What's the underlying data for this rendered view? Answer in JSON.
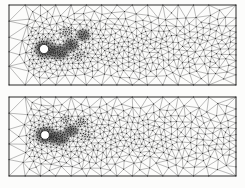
{
  "figure": {
    "background": "#fcfcfb",
    "width": 245,
    "height": 188
  },
  "mesh_style": {
    "line_color": "#3b3b3b",
    "line_width": 0.35,
    "node_color": "#161616",
    "node_size": 1.0,
    "border_color": "#2a2a2a",
    "border_width": 0.8,
    "cylinder_fill": "#ffffff",
    "cylinder_stroke": "#1a1a1a",
    "blob_underlay_color": "#000000",
    "blob_underlay_opacity": 0.38
  },
  "panels": [
    {
      "name": "mesh-panel-top",
      "frame": {
        "x": 9,
        "y": 5,
        "width": 227,
        "height": 80
      },
      "seed": 7,
      "cylinder": {
        "cx": 35,
        "cy": 44,
        "r": 4.6
      },
      "coarseH": 19,
      "edgeBand": 13,
      "wake": {
        "startX": 20,
        "h0": 4.3,
        "growX": 0.013,
        "centerY": 42,
        "spread": 10,
        "halfWidth": 40
      },
      "lumps": [
        {
          "cx": 36,
          "cy": 44,
          "rx": 13,
          "ry": 11,
          "h": 1.45
        },
        {
          "cx": 50,
          "cy": 47,
          "rx": 13,
          "ry": 9,
          "h": 1.5
        },
        {
          "cx": 62,
          "cy": 40,
          "rx": 9,
          "ry": 8,
          "h": 1.6
        },
        {
          "cx": 74,
          "cy": 30,
          "rx": 8,
          "ry": 7,
          "h": 1.7
        },
        {
          "cx": 58,
          "cy": 27,
          "rx": 7,
          "ry": 6,
          "h": 2.0
        },
        {
          "cx": 70,
          "cy": 51,
          "rx": 8,
          "ry": 6,
          "h": 2.3
        }
      ]
    },
    {
      "name": "mesh-panel-bottom",
      "frame": {
        "x": 9,
        "y": 97,
        "width": 227,
        "height": 79
      },
      "seed": 1234,
      "cylinder": {
        "cx": 36,
        "cy": 38,
        "r": 4.4
      },
      "coarseH": 19,
      "edgeBand": 13,
      "wake": {
        "startX": 20,
        "h0": 4.4,
        "growX": 0.013,
        "centerY": 40,
        "spread": 10,
        "halfWidth": 40
      },
      "lumps": [
        {
          "cx": 37,
          "cy": 38,
          "rx": 13,
          "ry": 10,
          "h": 1.45
        },
        {
          "cx": 50,
          "cy": 41,
          "rx": 12,
          "ry": 9,
          "h": 1.5
        },
        {
          "cx": 62,
          "cy": 34,
          "rx": 9,
          "ry": 7,
          "h": 1.65
        },
        {
          "cx": 72,
          "cy": 26,
          "rx": 7,
          "ry": 6,
          "h": 1.9
        },
        {
          "cx": 57,
          "cy": 23,
          "rx": 6,
          "ry": 5,
          "h": 2.1
        },
        {
          "cx": 78,
          "cy": 38,
          "rx": 7,
          "ry": 5,
          "h": 2.3
        }
      ]
    }
  ]
}
